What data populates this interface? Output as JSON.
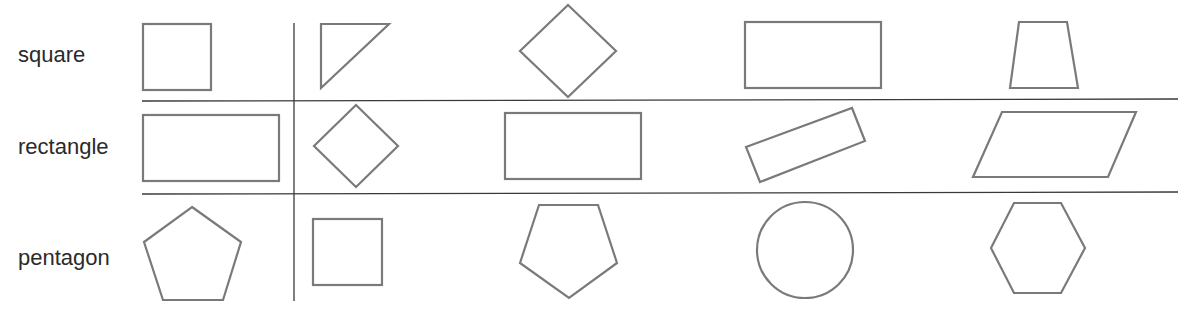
{
  "worksheet": {
    "rows": [
      {
        "label": "square",
        "example": "square",
        "options": [
          "right-triangle",
          "diamond-square",
          "rectangle",
          "trapezoid"
        ]
      },
      {
        "label": "rectangle",
        "example": "rectangle",
        "options": [
          "diamond-square",
          "rectangle",
          "tilted-rectangle",
          "parallelogram"
        ]
      },
      {
        "label": "pentagon",
        "example": "pentagon",
        "options": [
          "square",
          "pentagon",
          "circle",
          "hexagon"
        ]
      }
    ]
  },
  "colors": {
    "shape_stroke": "#7a7a7a",
    "rule_line": "#3a3a3a",
    "text": "#2a2a2a"
  }
}
